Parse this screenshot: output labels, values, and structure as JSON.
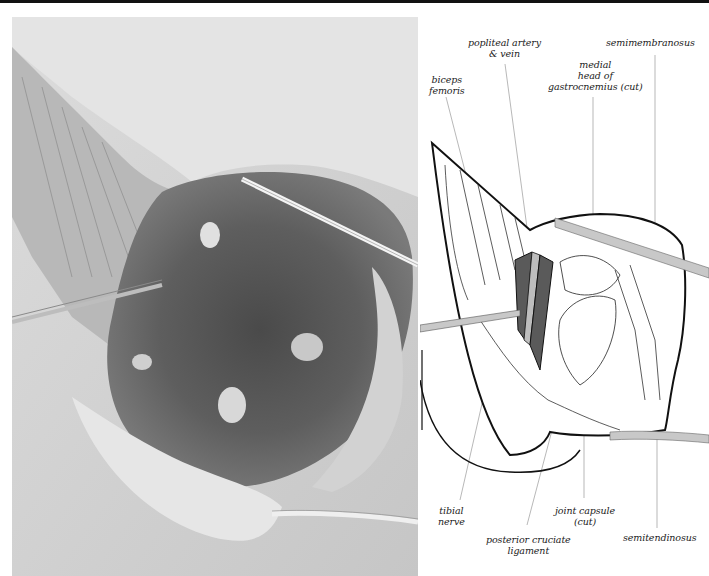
{
  "figure": {
    "photo": {
      "description": "Intraoperative photograph of posterior knee dissection with retractors"
    },
    "diagram": {
      "labels": {
        "popliteal": {
          "line1": "popliteal artery",
          "line2": "& vein"
        },
        "semimembranosus": "semimembranosus",
        "gastrocnemius": {
          "line1": "medial",
          "line2": "head of",
          "line3": "gastrocnemius (cut)"
        },
        "biceps": {
          "line1": "biceps",
          "line2": "femoris"
        },
        "tibial": {
          "line1": "tibial",
          "line2": "nerve"
        },
        "capsule": {
          "line1": "joint capsule",
          "line2": "(cut)"
        },
        "semitendinosus": "semitendinosus",
        "pcl": {
          "line1": "posterior cruciate",
          "line2": "ligament"
        }
      },
      "colors": {
        "outline": "#111111",
        "vessel": "#5a5a5a",
        "retractor": "#c8c8c8",
        "leader": "#9a9a9a"
      }
    }
  }
}
